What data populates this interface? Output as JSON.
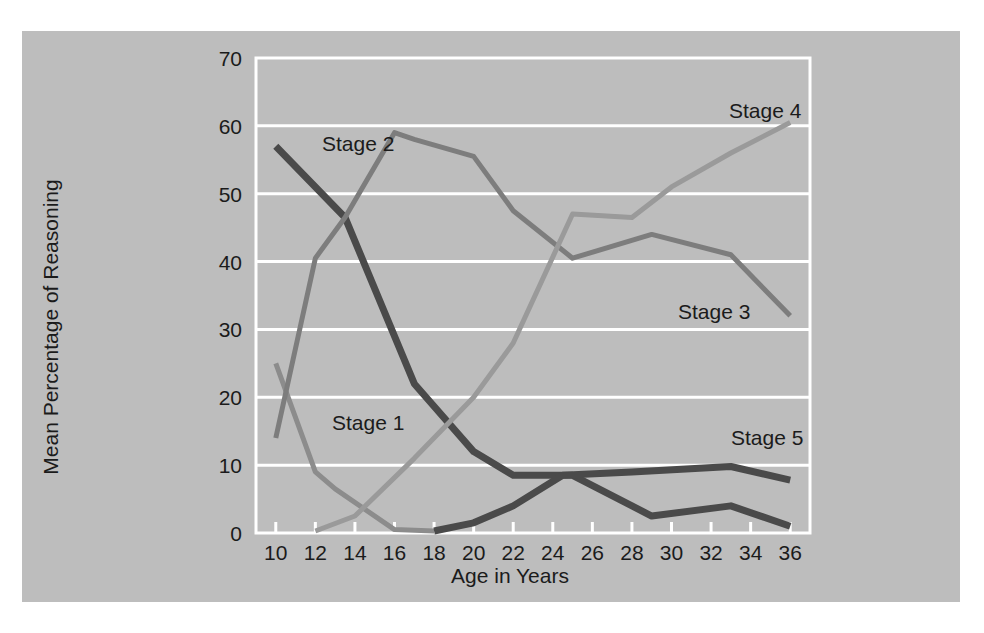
{
  "figure": {
    "background_color": "#ffffff",
    "panel_color": "#bdbdbd",
    "grid_color": "#ffffff"
  },
  "chart_data": {
    "type": "line",
    "title": "",
    "xlabel": "Age in Years",
    "ylabel": "Mean Percentage of Reasoning",
    "xlim": [
      9,
      37
    ],
    "ylim": [
      0,
      70
    ],
    "xticks": [
      10,
      12,
      14,
      16,
      18,
      20,
      22,
      24,
      26,
      28,
      30,
      32,
      34,
      36
    ],
    "yticks": [
      0,
      10,
      20,
      30,
      40,
      50,
      60,
      70
    ],
    "xtick_labels": [
      "10",
      "12",
      "14",
      "16",
      "18",
      "20",
      "22",
      "24",
      "26",
      "28",
      "30",
      "32",
      "34",
      "36"
    ],
    "ytick_labels": [
      "0",
      "10",
      "20",
      "30",
      "40",
      "50",
      "60",
      "70"
    ],
    "grid": true,
    "grid_axis": "y",
    "legend": "inline-labels",
    "series": [
      {
        "name": "Stage 1",
        "label": "Stage 1",
        "color": "#8c8c8c",
        "width": 5,
        "x": [
          10,
          12,
          13,
          16,
          18
        ],
        "values": [
          25,
          9,
          6.5,
          0.5,
          0.3
        ]
      },
      {
        "name": "Stage 2",
        "label": "Stage 2",
        "color": "#4a4a4a",
        "width": 7,
        "x": [
          10,
          13.5,
          17,
          20,
          22,
          25,
          29,
          33,
          36
        ],
        "values": [
          57,
          46.5,
          22,
          12,
          8.5,
          8.5,
          2.5,
          4,
          1
        ]
      },
      {
        "name": "Stage 3",
        "label": "Stage 3",
        "color": "#7d7d7d",
        "width": 5,
        "x": [
          10,
          12,
          13.5,
          16,
          17,
          20,
          22,
          25,
          29,
          33,
          36
        ],
        "values": [
          14,
          40.5,
          46.5,
          59,
          58,
          55.5,
          47.5,
          40.5,
          44,
          41,
          32
        ]
      },
      {
        "name": "Stage 4",
        "label": "Stage 4",
        "color": "#9a9a9a",
        "width": 5,
        "x": [
          12,
          14,
          17,
          20,
          22,
          25,
          28,
          30,
          33,
          36
        ],
        "values": [
          0.3,
          2.5,
          11,
          20,
          28,
          47,
          46.5,
          51,
          56,
          60.5
        ]
      },
      {
        "name": "Stage 5",
        "label": "Stage 5",
        "color": "#4a4a4a",
        "width": 7,
        "x": [
          18,
          20,
          22,
          24.5,
          28,
          33,
          36
        ],
        "values": [
          0.3,
          1.5,
          4,
          8.5,
          9,
          9.8,
          7.8
        ]
      }
    ],
    "series_label_positions": [
      {
        "name": "Stage 1",
        "label": "Stage 1",
        "x_px": 310,
        "y_px": 399
      },
      {
        "name": "Stage 2",
        "label": "Stage 2",
        "x_px": 300,
        "y_px": 120
      },
      {
        "name": "Stage 3",
        "label": "Stage 3",
        "x_px": 656,
        "y_px": 288
      },
      {
        "name": "Stage 4",
        "label": "Stage 4",
        "x_px": 707,
        "y_px": 87
      },
      {
        "name": "Stage 5",
        "label": "Stage 5",
        "x_px": 709,
        "y_px": 414
      }
    ]
  }
}
